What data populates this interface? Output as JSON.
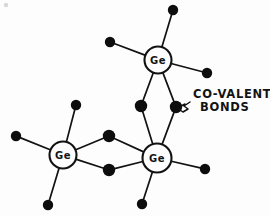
{
  "figure": {
    "background_color": "#fdfdfd",
    "ink_color": "#121212",
    "width": 270,
    "height": 216
  },
  "annotation": {
    "line1": "CO-VALENT",
    "line2": "BONDS",
    "leader_icon": "squiggly-arrow-icon",
    "points_to": "shared-electron-dot"
  },
  "atoms": [
    {
      "id": "ge-top",
      "label": "Ge",
      "cx": 158,
      "cy": 60,
      "r": 13.5
    },
    {
      "id": "ge-left",
      "label": "Ge",
      "cx": 63,
      "cy": 155,
      "r": 13.5
    },
    {
      "id": "ge-right",
      "label": "Ge",
      "cx": 157,
      "cy": 158,
      "r": 14.5
    }
  ],
  "electrons": [
    {
      "id": "dot-top-upper-right",
      "cx": 173,
      "cy": 10,
      "r": 5.2,
      "kind": "free"
    },
    {
      "id": "dot-top-upper-left",
      "cx": 110,
      "cy": 42,
      "r": 5.2,
      "kind": "free"
    },
    {
      "id": "dot-top-right",
      "cx": 207,
      "cy": 73,
      "r": 5.2,
      "kind": "free"
    },
    {
      "id": "dot-shared-left",
      "cx": 141,
      "cy": 106,
      "r": 6.2,
      "kind": "shared"
    },
    {
      "id": "dot-shared-right",
      "cx": 176,
      "cy": 107,
      "r": 6.2,
      "kind": "shared"
    },
    {
      "id": "dot-left-upper",
      "cx": 76,
      "cy": 105,
      "r": 5.2,
      "kind": "free"
    },
    {
      "id": "dot-left-far-left",
      "cx": 16,
      "cy": 136,
      "r": 5.2,
      "kind": "free"
    },
    {
      "id": "dot-left-bottom",
      "cx": 48,
      "cy": 205,
      "r": 5.2,
      "kind": "free"
    },
    {
      "id": "dot-mid-upper",
      "cx": 109,
      "cy": 136,
      "r": 6.2,
      "kind": "shared"
    },
    {
      "id": "dot-mid-lower",
      "cx": 109,
      "cy": 170,
      "r": 6.2,
      "kind": "shared"
    },
    {
      "id": "dot-right-right",
      "cx": 205,
      "cy": 169,
      "r": 5.2,
      "kind": "free"
    },
    {
      "id": "dot-right-bottom",
      "cx": 142,
      "cy": 204,
      "r": 5.2,
      "kind": "free"
    }
  ],
  "bonds": [
    {
      "id": "bond-top-to-ne",
      "from": "ge-top",
      "to": "dot-top-upper-right"
    },
    {
      "id": "bond-top-to-nw",
      "from": "ge-top",
      "to": "dot-top-upper-left"
    },
    {
      "id": "bond-top-to-e",
      "from": "ge-top",
      "to": "dot-top-right"
    },
    {
      "id": "bond-top-to-shared-l",
      "from": "ge-top",
      "to": "dot-shared-left"
    },
    {
      "id": "bond-top-to-shared-r",
      "from": "ge-top",
      "to": "dot-shared-right"
    },
    {
      "id": "bond-right-to-shared-l",
      "from": "ge-right",
      "to": "dot-shared-left"
    },
    {
      "id": "bond-right-to-shared-r",
      "from": "ge-right",
      "to": "dot-shared-right"
    },
    {
      "id": "bond-left-to-n",
      "from": "ge-left",
      "to": "dot-left-upper"
    },
    {
      "id": "bond-left-to-w",
      "from": "ge-left",
      "to": "dot-left-far-left"
    },
    {
      "id": "bond-left-to-s",
      "from": "ge-left",
      "to": "dot-left-bottom"
    },
    {
      "id": "bond-left-to-mid-up",
      "from": "ge-left",
      "to": "dot-mid-upper"
    },
    {
      "id": "bond-left-to-mid-low",
      "from": "ge-left",
      "to": "dot-mid-lower"
    },
    {
      "id": "bond-right-to-mid-up",
      "from": "ge-right",
      "to": "dot-mid-upper"
    },
    {
      "id": "bond-right-to-mid-low",
      "from": "ge-right",
      "to": "dot-mid-lower"
    },
    {
      "id": "bond-right-to-e",
      "from": "ge-right",
      "to": "dot-right-right"
    },
    {
      "id": "bond-right-to-s",
      "from": "ge-right",
      "to": "dot-right-bottom"
    }
  ],
  "annotation_position": {
    "text_x": 193,
    "text_y1": 98,
    "text_y2": 111
  }
}
